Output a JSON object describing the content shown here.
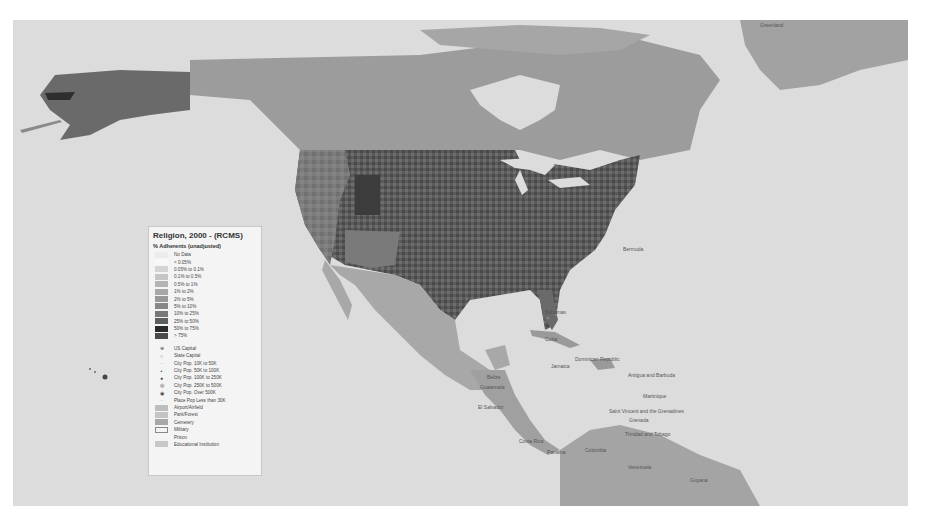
{
  "legend": {
    "title": "Religion, 2000 - (RCMS)",
    "subtitle": "% Adherents (unadjusted)",
    "classes": [
      {
        "label": "No Data",
        "color": "#ececec"
      },
      {
        "label": "< 0.05%",
        "color": "#f8f8f8"
      },
      {
        "label": "0.05% to 0.1%",
        "color": "#d4d4d4"
      },
      {
        "label": "0.1% to 0.5%",
        "color": "#c6c6c6"
      },
      {
        "label": "0.5% to 1%",
        "color": "#b4b4b4"
      },
      {
        "label": "1% to 2%",
        "color": "#a8a8a8"
      },
      {
        "label": "2% to 5%",
        "color": "#989898"
      },
      {
        "label": "5% to 10%",
        "color": "#888888"
      },
      {
        "label": "10% to 25%",
        "color": "#787878"
      },
      {
        "label": "25% to 50%",
        "color": "#5e5e5e"
      },
      {
        "label": "50% to 75%",
        "color": "#2a2a2a"
      },
      {
        "label": "> 75%",
        "color": "#4a4a4a"
      }
    ],
    "symbols": [
      {
        "label": "US Capital",
        "glyph": "⊛"
      },
      {
        "label": "State Capital",
        "glyph": "○"
      },
      {
        "label": "City Pop. 10K to 50K",
        "glyph": "·"
      },
      {
        "label": "City Pop. 50K to 100K",
        "glyph": "•"
      },
      {
        "label": "City Pop. 100K to 250K",
        "glyph": "●"
      },
      {
        "label": "City Pop. 250K to 500K",
        "glyph": "◎"
      },
      {
        "label": "City Pop. Over 500K",
        "glyph": "◉"
      },
      {
        "label": "Place Pop Less than 30K",
        "glyph": "·"
      }
    ],
    "areas": [
      {
        "label": "Airport/Airfield",
        "color": "#bdbdbd",
        "border": "#bdbdbd"
      },
      {
        "label": "Park/Forest",
        "color": "#c4c4c4",
        "border": "#c4c4c4"
      },
      {
        "label": "Cemetery",
        "color": "#a8a8a8",
        "border": "#a8a8a8"
      },
      {
        "label": "Military",
        "color": "#f4f4f4",
        "border": "#888888"
      },
      {
        "label": "Prison",
        "color": "transparent",
        "border": "transparent"
      },
      {
        "label": "Educational Institution",
        "color": "#c8c8c8",
        "border": "#c8c8c8"
      }
    ]
  },
  "map_labels": [
    {
      "text": "Greenland",
      "x": 760,
      "y": 22
    },
    {
      "text": "Bermuda",
      "x": 623,
      "y": 246
    },
    {
      "text": "Bahamas",
      "x": 545,
      "y": 309
    },
    {
      "text": "Cuba",
      "x": 545,
      "y": 336
    },
    {
      "text": "Dominican Republic",
      "x": 575,
      "y": 356
    },
    {
      "text": "Jamaica",
      "x": 551,
      "y": 363
    },
    {
      "text": "Antigua and Barbuda",
      "x": 628,
      "y": 372
    },
    {
      "text": "Martinique",
      "x": 643,
      "y": 393
    },
    {
      "text": "Saint Vincent and the Grenadines",
      "x": 609,
      "y": 408
    },
    {
      "text": "Grenada",
      "x": 629,
      "y": 417
    },
    {
      "text": "Trinidad and Tobago",
      "x": 625,
      "y": 431
    },
    {
      "text": "Belize",
      "x": 487,
      "y": 374
    },
    {
      "text": "Guatemala",
      "x": 480,
      "y": 384
    },
    {
      "text": "El Salvador",
      "x": 478,
      "y": 404
    },
    {
      "text": "Costa Rica",
      "x": 519,
      "y": 438
    },
    {
      "text": "Panama",
      "x": 547,
      "y": 449
    },
    {
      "text": "Colombia",
      "x": 585,
      "y": 447
    },
    {
      "text": "Venezuela",
      "x": 628,
      "y": 464
    },
    {
      "text": "Guyana",
      "x": 690,
      "y": 477
    }
  ]
}
